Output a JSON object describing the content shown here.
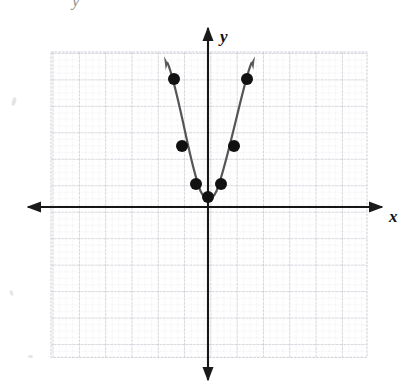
{
  "figure": {
    "kind": "coordinate-plane-graph",
    "background_color": "#ffffff",
    "scan_artifact_glyph": "y"
  },
  "axes": {
    "x_label": "x",
    "y_label": "y",
    "axis_color": "#1a1a1a",
    "x_axis_pixel_y": 207,
    "y_axis_pixel_x": 208,
    "arrowheads": [
      "left",
      "right",
      "up",
      "down"
    ]
  },
  "grid": {
    "left": 51,
    "top": 52,
    "right": 367,
    "bottom": 357,
    "major_step_px": 26.3,
    "minor_per_major": 4,
    "major_color": "#b9b9c4",
    "minor_color": "#d8d8e0",
    "visible": true
  },
  "chart_data": {
    "type": "scatter",
    "title": "",
    "subtitle": "",
    "xlabel": "x",
    "ylabel": "y",
    "xlim": [
      -6,
      6
    ],
    "ylim": [
      -6,
      6
    ],
    "grid": true,
    "legend": null,
    "series": [
      {
        "name": "parabola",
        "kind": "curve",
        "equation": "y = 3x^2",
        "color": "#555555",
        "points": [
          {
            "x": -1.3,
            "y": 4.9
          },
          {
            "x": -1.0,
            "y": 2.3
          },
          {
            "x": -0.47,
            "y": 0.9
          },
          {
            "x": 0.0,
            "y": 0.4
          },
          {
            "x": 0.47,
            "y": 0.9
          },
          {
            "x": 1.0,
            "y": 2.3
          },
          {
            "x": 1.3,
            "y": 4.9
          }
        ],
        "marker": "filled-circle",
        "marker_color": "#111111",
        "marker_radius_px": 6
      }
    ],
    "plotted_markers_px": [
      {
        "cx": 174,
        "cy": 79
      },
      {
        "cx": 182,
        "cy": 146
      },
      {
        "cx": 196,
        "cy": 184
      },
      {
        "cx": 208,
        "cy": 197
      },
      {
        "cx": 221,
        "cy": 184
      },
      {
        "cx": 234,
        "cy": 146
      },
      {
        "cx": 247,
        "cy": 79
      }
    ],
    "curve_path_px": "M 167.5 63 C 170 68 177 95 183 122 C 188 145 194 175 200.5 191 C 204 198.5 206 197.5 208 197.5 C 210.5 197.5 213 199 216.5 191 C 223 175 230 144 236 120 C 242 95 248 70 251.5 63"
  }
}
